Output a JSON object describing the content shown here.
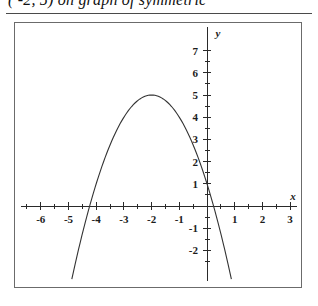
{
  "header": {
    "text_clipped": "( -2, 5) on graph of symmetric"
  },
  "figure": {
    "frame_label": "coordinate-plane-figure",
    "x_axis_name": "x",
    "y_axis_name": "y"
  },
  "chart_data": {
    "type": "line",
    "title": "",
    "subtitle": "",
    "xlabel": "x",
    "ylabel": "y",
    "xlim": [
      -7,
      3
    ],
    "ylim": [
      -2.6,
      7
    ],
    "grid": false,
    "legend": "none",
    "x_ticks": [
      -6,
      -5,
      -4,
      -3,
      -2,
      -1,
      1,
      2,
      3
    ],
    "x_tick_labels": [
      "-6",
      "-5",
      "-4",
      "-3",
      "-2",
      "-1",
      "1",
      "2",
      "3"
    ],
    "y_ticks": [
      7,
      6,
      5,
      4,
      3,
      2,
      1,
      -1,
      -2
    ],
    "y_tick_labels": [
      "7",
      "6",
      "5",
      "4",
      "3",
      "2",
      "1",
      "-1",
      "-2"
    ],
    "minor_tick_step": 0.5,
    "annotations": [],
    "series": [
      {
        "name": "downward parabola",
        "equation": "y = -(x + 2)^2 + 5",
        "vertex": [
          -2,
          5
        ],
        "opens": "down",
        "roots": [
          -4.24,
          0.24
        ],
        "y_intercept": 1,
        "x": [
          -4.7,
          -4.5,
          -4.25,
          -4.0,
          -3.75,
          -3.5,
          -3.25,
          -3.0,
          -2.75,
          -2.5,
          -2.25,
          -2.0,
          -1.75,
          -1.5,
          -1.25,
          -1.0,
          -0.75,
          -0.5,
          -0.25,
          0.0,
          0.25,
          0.5,
          0.75,
          1.0
        ],
        "y": [
          -2.29,
          -1.25,
          -0.06,
          1.0,
          1.94,
          2.75,
          3.44,
          4.0,
          4.44,
          4.75,
          4.94,
          5.0,
          4.94,
          4.75,
          4.44,
          4.0,
          3.44,
          2.75,
          1.94,
          1.0,
          -0.06,
          -1.25,
          -2.56,
          -4.0
        ]
      }
    ]
  }
}
